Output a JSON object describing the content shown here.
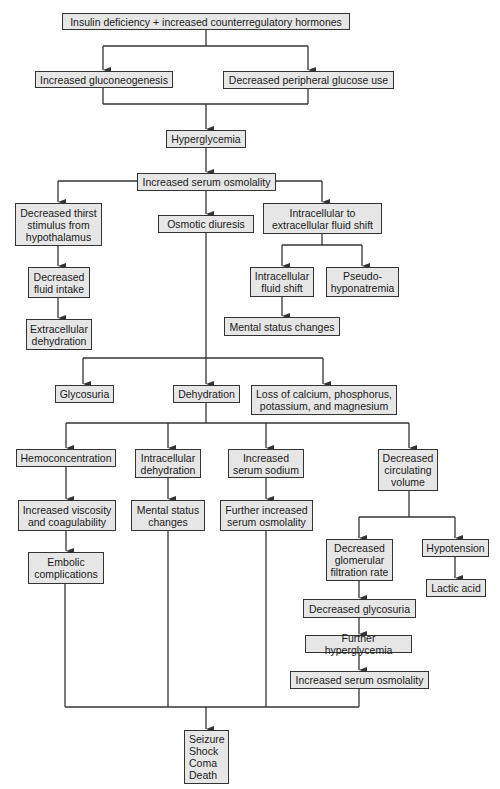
{
  "colors": {
    "box_fill": "#e6e6e6",
    "box_border": "#333333",
    "line": "#333333",
    "text": "#1a1a1a"
  },
  "nodes": {
    "insulin": "Insulin deficiency + increased counterregulatory hormones",
    "gluconeo": "Increased gluconeogenesis",
    "periph": "Decreased peripheral glucose use",
    "hyperglycemia": "Hyperglycemia",
    "osmolality": "Increased serum osmolality",
    "thirst": "Decreased thirst\nstimulus from\nhypothalamus",
    "diuresis": "Osmotic diuresis",
    "shift": "Intracellular to\nextracellular fluid shift",
    "fluid_intake": "Decreased\nfluid intake",
    "ecf_dehyd": "Extracellular\ndehydration",
    "icf_shift": "Intracellular\nfluid shift",
    "pseudo": "Pseudo-\nhyponatremia",
    "mental1": "Mental status changes",
    "glycosuria": "Glycosuria",
    "dehydration": "Dehydration",
    "loss": "Loss of calcium, phosphorus,\npotassium, and magnesium",
    "hemoconc": "Hemoconcentration",
    "icf_dehyd": "Intracellular\ndehydration",
    "na": "Increased\nserum sodium",
    "circ": "Decreased\ncirculating\nvolume",
    "viscosity": "Increased viscosity\nand coagulability",
    "mental2": "Mental status\nchanges",
    "further_osm": "Further increased\nserum osmolality",
    "embolic": "Embolic\ncomplications",
    "gfr": "Decreased\nglomerular\nfiltration rate",
    "hypotension": "Hypotension",
    "lactic": "Lactic acid",
    "dec_glycosuria": "Decreased glycosuria",
    "further_hyper": "Further hyperglycemia",
    "osm2": "Increased serum osmolality",
    "outcome": "Seizure\nShock\nComa\nDeath"
  }
}
